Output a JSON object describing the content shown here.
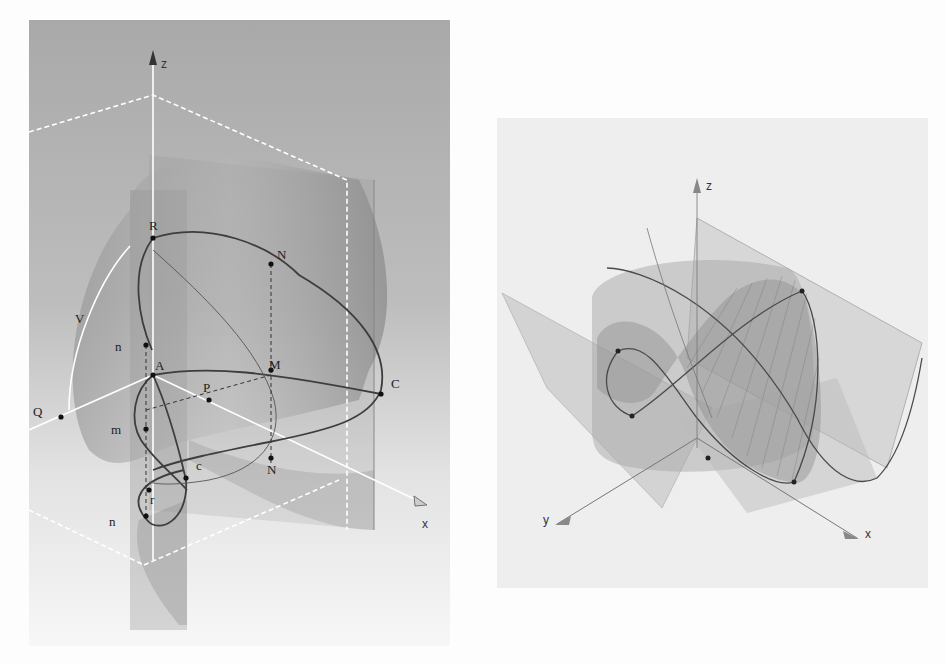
{
  "figures": {
    "left": {
      "axes": {
        "z": "z",
        "x": "x"
      },
      "points": {
        "R": "R",
        "N_top": "N",
        "V": "V",
        "n_upper": "n",
        "A": "A",
        "M": "M",
        "C": "C",
        "P": "P",
        "Q": "Q",
        "m": "m",
        "c": "c",
        "N_bottom": "N",
        "r": "r",
        "n_lower": "n"
      },
      "colors": {
        "background_top": "#a8a8a8",
        "background_bottom": "#f4f4f4",
        "curve": "#444444",
        "guide": "#ffffff"
      }
    },
    "right": {
      "axes": {
        "z": "z",
        "y": "y",
        "x": "x"
      },
      "point_count": 6,
      "colors": {
        "background": "#eeeeee",
        "surface": "#9a9a9a",
        "curve": "#555555"
      }
    }
  }
}
